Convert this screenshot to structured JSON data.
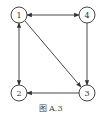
{
  "figure": {
    "caption": "图 A.3",
    "nodes": [
      {
        "id": "1",
        "label": "1",
        "x": 19,
        "y": 15
      },
      {
        "id": "4",
        "label": "4",
        "x": 87,
        "y": 15
      },
      {
        "id": "2",
        "label": "2",
        "x": 19,
        "y": 93
      },
      {
        "id": "3",
        "label": "3",
        "x": 87,
        "y": 93
      }
    ],
    "edges": [
      {
        "from": "1",
        "to": "4",
        "bidirectional": true
      },
      {
        "from": "1",
        "to": "2",
        "bidirectional": true
      },
      {
        "from": "1",
        "to": "3",
        "bidirectional": false
      },
      {
        "from": "4",
        "to": "3",
        "bidirectional": false
      },
      {
        "from": "3",
        "to": "2",
        "bidirectional": false
      }
    ]
  }
}
